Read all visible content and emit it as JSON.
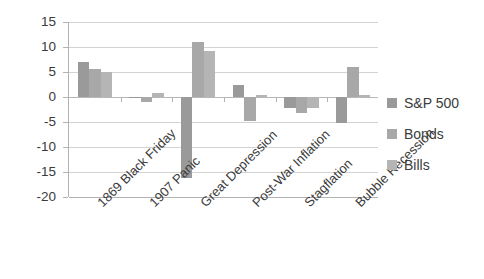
{
  "chart_data": {
    "type": "bar",
    "title": "",
    "xlabel": "",
    "ylabel": "",
    "ylim": [
      -20,
      15
    ],
    "yticks": [
      15,
      10,
      5,
      0,
      -5,
      -10,
      -15,
      -20
    ],
    "grid": true,
    "legend_position": "right",
    "categories": [
      "1869 Black Friday",
      "1907 Panic",
      "Great Depression",
      "Post-War Inflation",
      "Stagflation",
      "Bubble Recession"
    ],
    "series": [
      {
        "name": "S&P 500",
        "color": "#9a9a9a",
        "values": [
          7.0,
          -0.2,
          -16.2,
          2.5,
          -2.2,
          -5.2
        ]
      },
      {
        "name": "Bonds",
        "color": "#a8a8a8",
        "values": [
          5.6,
          -1.0,
          11.0,
          -4.8,
          -3.2,
          6.0
        ]
      },
      {
        "name": "Bills",
        "color": "#b5b5b5",
        "values": [
          5.0,
          0.8,
          9.3,
          0.4,
          -2.1,
          0.5
        ]
      }
    ]
  },
  "axis": {
    "tick_labels": [
      "15",
      "10",
      "5",
      "0",
      "-5",
      "-10",
      "-15",
      "-20"
    ]
  },
  "legend": {
    "items": [
      {
        "label": "S&P 500"
      },
      {
        "label": "Bonds"
      },
      {
        "label": "Bills"
      }
    ]
  }
}
